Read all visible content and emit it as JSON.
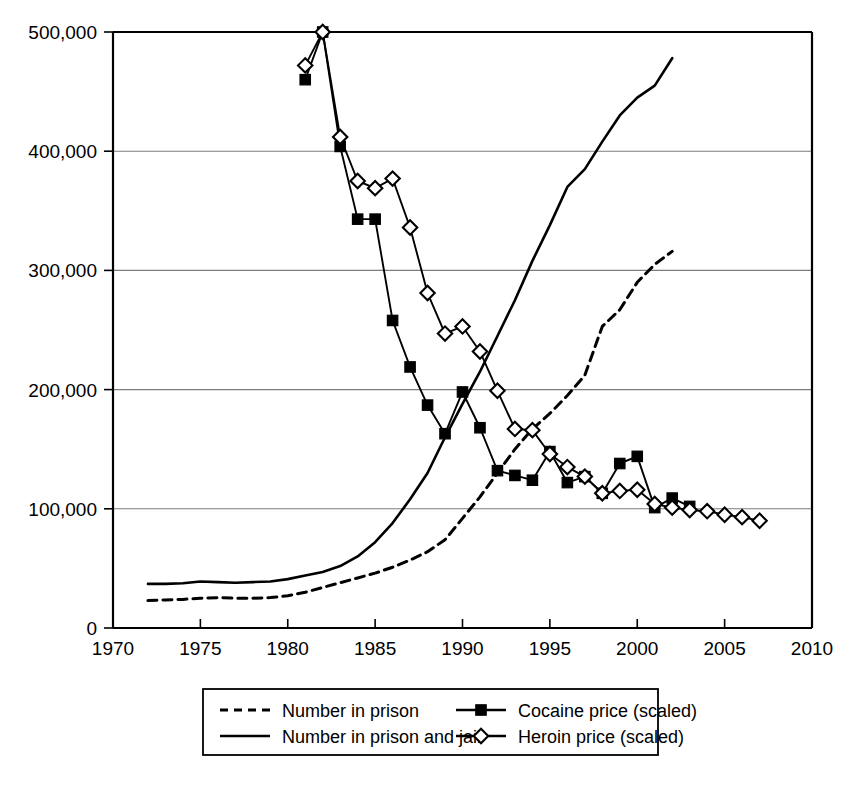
{
  "chart_data": {
    "type": "line",
    "title": "",
    "subtitle": "",
    "xlabel": "",
    "ylabel": "",
    "xlim": [
      1970,
      2010
    ],
    "ylim": [
      0,
      500000
    ],
    "xticks": [
      1970,
      1975,
      1980,
      1985,
      1990,
      1995,
      2000,
      2005,
      2010
    ],
    "xtick_labels": [
      "1970",
      "1975",
      "1980",
      "1985",
      "1990",
      "1995",
      "2000",
      "2005",
      "2010"
    ],
    "yticks": [
      0,
      100000,
      200000,
      300000,
      400000,
      500000
    ],
    "ytick_labels": [
      "0",
      "100,000",
      "200,000",
      "300,000",
      "400,000",
      "500,000"
    ],
    "grid": "horizontal",
    "legend_position": "bottom-center",
    "series": [
      {
        "name": "Number in prison",
        "style": "dashed",
        "marker": "none",
        "color": "#000000",
        "x": [
          1972,
          1973,
          1974,
          1975,
          1976,
          1977,
          1978,
          1979,
          1980,
          1981,
          1982,
          1983,
          1984,
          1985,
          1986,
          1987,
          1988,
          1989,
          1990,
          1991,
          1992,
          1993,
          1994,
          1995,
          1996,
          1997,
          1998,
          1999,
          2000,
          2001,
          2002
        ],
        "values": [
          23000,
          23500,
          24000,
          25000,
          25500,
          25000,
          25000,
          25500,
          27000,
          30000,
          34000,
          38000,
          42000,
          46000,
          51000,
          57000,
          64000,
          74000,
          92000,
          110000,
          130000,
          150000,
          167000,
          180000,
          195000,
          212000,
          253000,
          267000,
          290000,
          305000,
          316000
        ]
      },
      {
        "name": "Number in prison and jail",
        "style": "solid",
        "marker": "none",
        "color": "#000000",
        "x": [
          1972,
          1973,
          1974,
          1975,
          1976,
          1977,
          1978,
          1979,
          1980,
          1981,
          1982,
          1983,
          1984,
          1985,
          1986,
          1987,
          1988,
          1989,
          1990,
          1991,
          1992,
          1993,
          1994,
          1995,
          1996,
          1997,
          1998,
          1999,
          2000,
          2001,
          2002
        ],
        "values": [
          37000,
          37000,
          37500,
          39000,
          38500,
          38000,
          38500,
          39000,
          41000,
          44000,
          47000,
          52000,
          60000,
          72000,
          88000,
          108000,
          130000,
          160000,
          188000,
          215000,
          245000,
          275000,
          308000,
          338000,
          370000,
          385000,
          408000,
          430000,
          445000,
          455000,
          478000
        ]
      },
      {
        "name": "Cocaine price (scaled)",
        "style": "solid",
        "marker": "filled-square",
        "color": "#000000",
        "x": [
          1981,
          1982,
          1983,
          1984,
          1985,
          1986,
          1987,
          1988,
          1989,
          1990,
          1991,
          1992,
          1993,
          1994,
          1995,
          1996,
          1997,
          1998,
          1999,
          2000,
          2001,
          2002,
          2003
        ],
        "values": [
          460000,
          500000,
          404000,
          343000,
          343000,
          258000,
          219000,
          187000,
          163000,
          198000,
          168000,
          132000,
          128000,
          124000,
          148000,
          122000,
          127000,
          113000,
          138000,
          144000,
          101000,
          109000,
          102000
        ]
      },
      {
        "name": "Heroin price (scaled)",
        "style": "solid",
        "marker": "open-diamond",
        "color": "#000000",
        "x": [
          1981,
          1982,
          1983,
          1984,
          1985,
          1986,
          1987,
          1988,
          1989,
          1990,
          1991,
          1992,
          1993,
          1994,
          1995,
          1996,
          1997,
          1998,
          1999,
          2000,
          2001,
          2002,
          2003,
          2004,
          2005,
          2006,
          2007
        ],
        "values": [
          472000,
          500000,
          412000,
          375000,
          369000,
          377000,
          336000,
          281000,
          247000,
          253000,
          232000,
          199000,
          167000,
          166000,
          146000,
          135000,
          127000,
          113000,
          115000,
          116000,
          104000,
          101000,
          99000,
          98000,
          95000,
          93000,
          90000
        ]
      }
    ]
  },
  "legend": {
    "entries": [
      {
        "label": "Number in prison",
        "style": "dashed",
        "marker": "none"
      },
      {
        "label": "Number in prison and jail",
        "style": "solid",
        "marker": "none"
      },
      {
        "label": "Cocaine price (scaled)",
        "style": "solid",
        "marker": "filled-square"
      },
      {
        "label": "Heroin price (scaled)",
        "style": "solid",
        "marker": "open-diamond"
      }
    ]
  }
}
